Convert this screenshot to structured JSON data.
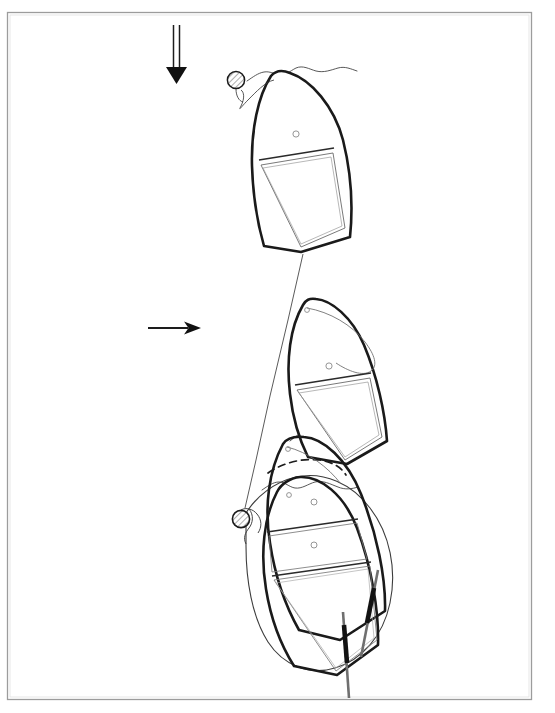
{
  "document": {
    "type": "technical-line-drawing",
    "title": "",
    "caption": "",
    "background_color": "#ffffff",
    "ink_color": "#1a1a1a",
    "light_ink_color": "#555555",
    "frame_color": "#9a9a9a"
  },
  "frame": {
    "name": "page-border",
    "x": 7,
    "y": 12,
    "width": 525,
    "height": 688,
    "stroke_color": "#9a9a9a",
    "stroke_width": 1.2
  },
  "annotations": {
    "arrows": [
      {
        "name": "down-arrow",
        "direction": "down",
        "style": "double-line",
        "x1": 176,
        "y1": 25,
        "x2": 176,
        "y2": 80,
        "label": ""
      },
      {
        "name": "right-arrow",
        "direction": "right",
        "style": "single-line",
        "x1": 148,
        "y1": 328,
        "x2": 198,
        "y2": 328,
        "label": ""
      }
    ]
  },
  "scene": {
    "description": "Boat shown in three successive positions approaching and picking up a mooring buoy",
    "buoys": [
      {
        "name": "mooring-buoy-upper",
        "cx": 236,
        "cy": 80,
        "r": 8.5,
        "fill": "hatched"
      },
      {
        "name": "mooring-buoy-lower",
        "cx": 241,
        "cy": 519,
        "r": 8.5,
        "fill": "hatched"
      }
    ],
    "boats": [
      {
        "name": "boat-position-1",
        "label": "",
        "rotation_deg": 11,
        "center_x": 302,
        "center_y": 168
      },
      {
        "name": "boat-position-2",
        "label": "",
        "rotation_deg": 18,
        "center_x": 333,
        "center_y": 388
      },
      {
        "name": "boat-position-3",
        "label": "",
        "rotation_deg": 27,
        "center_x": 332,
        "center_y": 532
      },
      {
        "name": "boat-position-4",
        "label": "",
        "rotation_deg": -8,
        "center_x": 322,
        "center_y": 570
      }
    ],
    "poles": [
      {
        "name": "boat-hook-pole-right",
        "x1": 381,
        "y1": 572,
        "x2": 351,
        "y2": 658
      },
      {
        "name": "boat-hook-pole-left",
        "x1": 345,
        "y1": 612,
        "x2": 352,
        "y2": 697
      }
    ],
    "mooring_line": {
      "name": "mooring-line",
      "from": "boat-position-1-stern",
      "to": "mooring-buoy-lower"
    },
    "swing_arc": {
      "name": "swing-path-dashed-arc",
      "style": "dashed"
    },
    "wake_outline": {
      "name": "wake-outline",
      "style": "thin-curve"
    },
    "water_lines": [
      {
        "name": "water-surface-line-1",
        "y": 72
      },
      {
        "name": "water-surface-line-2",
        "y": 440
      },
      {
        "name": "water-surface-line-3",
        "y": 487
      }
    ]
  }
}
